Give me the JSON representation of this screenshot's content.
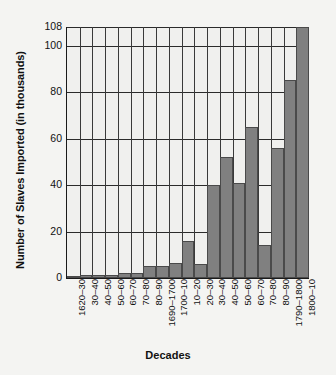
{
  "chart_data": {
    "type": "bar",
    "title": "",
    "xlabel": "Decades",
    "ylabel": "Number of Slaves Imported (in thousands)",
    "ylim": [
      0,
      108
    ],
    "yticks": [
      0,
      20,
      40,
      60,
      80,
      100,
      108
    ],
    "grid": true,
    "legend": "none",
    "bar_color": "#808080",
    "categories": [
      "1620–30",
      "30–40",
      "40–50",
      "50–60",
      "60–70",
      "70–80",
      "80–90",
      "1690–1700",
      "1700–10",
      "10–20",
      "20–30",
      "30–40",
      "40–50",
      "50–60",
      "60–70",
      "70–80",
      "80–90",
      "1790–1800",
      "1800–10"
    ],
    "values": [
      1,
      1.5,
      1.5,
      1.5,
      2,
      2,
      5,
      5,
      6.5,
      16,
      6,
      40,
      52,
      41,
      65,
      14,
      56,
      85,
      108
    ]
  }
}
